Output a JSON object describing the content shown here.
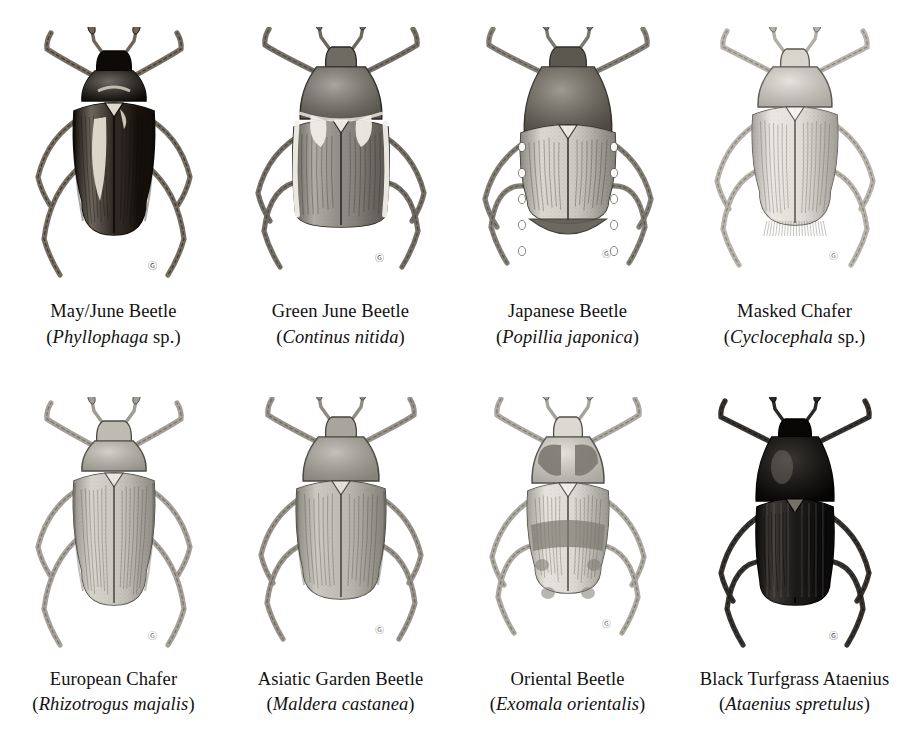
{
  "plate": {
    "background_color": "#ffffff",
    "text_color": "#111111",
    "columns": 4,
    "rows": 2
  },
  "beetles": [
    {
      "common_name": "May/June Beetle",
      "scientific_open": "(",
      "latin_name": "Phyllophaga",
      "latin_suffix": " sp.",
      "scientific_close": ")",
      "body_color": "#15100c",
      "pronotum_color": "#0d0a07",
      "elytra_color": "#1a130d",
      "highlight_color": "#e8e2d6",
      "leg_color": "#6e6558",
      "outline_color": "#0a0806",
      "body_shape": "elongate-oval",
      "icon": "beetle-icon"
    },
    {
      "common_name": "Green June Beetle",
      "scientific_open": "(",
      "latin_name": "Continus nitida",
      "latin_suffix": "",
      "scientific_close": ")",
      "body_color": "#7e7a72",
      "pronotum_color": "#6f6b63",
      "elytra_color": "#85817a",
      "highlight_color": "#f2efe8",
      "leg_color": "#6b665e",
      "outline_color": "#2a2823",
      "body_shape": "broad-rectangular",
      "icon": "beetle-icon"
    },
    {
      "common_name": "Japanese Beetle",
      "scientific_open": "(",
      "latin_name": "Popillia japonica",
      "latin_suffix": "",
      "scientific_close": ")",
      "body_color": "#9a958c",
      "pronotum_color": "#5d584f",
      "elytra_color": "#cfcbc3",
      "highlight_color": "#efece5",
      "leg_color": "#7c776e",
      "outline_color": "#33302b",
      "body_shape": "oval-broad",
      "icon": "beetle-icon"
    },
    {
      "common_name": "Masked Chafer",
      "scientific_open": "(",
      "latin_name": "Cyclocephala",
      "latin_suffix": " sp.",
      "scientific_close": ")",
      "body_color": "#dedbd4",
      "pronotum_color": "#d8d5cd",
      "elytra_color": "#e3e0d9",
      "highlight_color": "#f7f6f2",
      "leg_color": "#b3afa7",
      "outline_color": "#5a574f",
      "body_shape": "oval",
      "icon": "beetle-icon"
    },
    {
      "common_name": "European Chafer",
      "scientific_open": "(",
      "latin_name": "Rhizotrogus majalis",
      "latin_suffix": "",
      "scientific_close": ")",
      "body_color": "#c6c2ba",
      "pronotum_color": "#bfbbb3",
      "elytra_color": "#cac6be",
      "highlight_color": "#eceae4",
      "leg_color": "#a09b93",
      "outline_color": "#4c4942",
      "body_shape": "elongate-oval",
      "icon": "beetle-icon"
    },
    {
      "common_name": "Asiatic Garden Beetle",
      "scientific_open": "(",
      "latin_name": "Maldera castanea",
      "latin_suffix": "",
      "scientific_close": ")",
      "body_color": "#b4b0a8",
      "pronotum_color": "#a9a59d",
      "elytra_color": "#bcb8b0",
      "highlight_color": "#e7e4de",
      "leg_color": "#908b83",
      "outline_color": "#46433c",
      "body_shape": "broad-oval",
      "icon": "beetle-icon"
    },
    {
      "common_name": "Oriental Beetle",
      "scientific_open": "(",
      "latin_name": "Exomala orientalis",
      "latin_suffix": "",
      "scientific_close": ")",
      "body_color": "#d2cfc8",
      "pronotum_color": "#dcd9d2",
      "elytra_color": "#dfdcd5",
      "highlight_color": "#f2f0eb",
      "mottle_color": "#7e7a72",
      "leg_color": "#a8a49c",
      "outline_color": "#4f4c45",
      "body_shape": "oval-mottled",
      "icon": "beetle-icon"
    },
    {
      "common_name": "Black Turfgrass Ataenius",
      "scientific_open": "(",
      "latin_name": "Ataenius spretulus",
      "latin_suffix": "",
      "scientific_close": ")",
      "body_color": "#0d0b09",
      "pronotum_color": "#070605",
      "elytra_color": "#121010",
      "highlight_color": "#7a766e",
      "leg_color": "#2b2825",
      "outline_color": "#000000",
      "body_shape": "elongate-cylindrical",
      "icon": "beetle-icon"
    }
  ]
}
